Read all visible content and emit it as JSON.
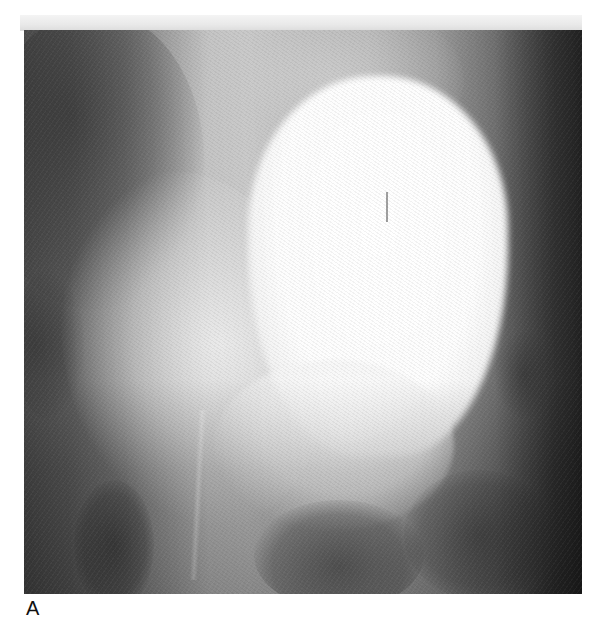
{
  "figure": {
    "type": "radiograph",
    "panel_label": "A",
    "colors": {
      "background": "#ffffff",
      "film_dark": "#2e2e2e",
      "film_mid": "#8a8a8a",
      "contrast_bright": "#ffffff",
      "top_band": "#e9e9e9"
    }
  }
}
